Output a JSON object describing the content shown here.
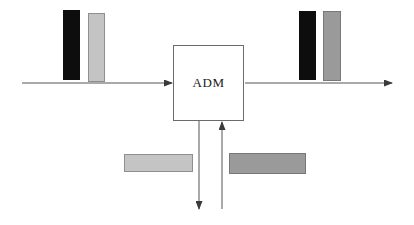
{
  "diagram": {
    "background_color": "#ffffff",
    "line_color": "#555555",
    "node": {
      "label": "ADM",
      "name": "adm-node",
      "x": 173,
      "y": 45,
      "width": 71,
      "height": 76,
      "border_color": "#6b6b6b",
      "fill_color": "#ffffff",
      "border_width": 1
    },
    "arrows": [
      {
        "name": "west-input-arrow",
        "direction": "east",
        "x1": 22,
        "y1": 83,
        "x2": 172,
        "y2": 83,
        "color": "#555555"
      },
      {
        "name": "east-output-arrow",
        "direction": "east",
        "x1": 245,
        "y1": 83,
        "x2": 392,
        "y2": 83,
        "color": "#555555"
      },
      {
        "name": "drop-arrow",
        "direction": "south",
        "x1": 199,
        "y1": 121,
        "x2": 199,
        "y2": 209,
        "color": "#555555"
      },
      {
        "name": "add-arrow",
        "direction": "north",
        "x1": 222,
        "y1": 209,
        "x2": 222,
        "y2": 122,
        "color": "#555555"
      }
    ],
    "bars": [
      {
        "name": "west-channel-bar-dark",
        "orientation": "vertical",
        "x": 63,
        "y": 10,
        "width": 17,
        "height": 70,
        "fill_color": "#0d0d0d",
        "border_color": "#0d0d0d"
      },
      {
        "name": "west-channel-bar-light",
        "orientation": "vertical",
        "x": 88,
        "y": 13,
        "width": 17,
        "height": 69,
        "fill_color": "#c4c4c4",
        "border_color": "#8f8f8f"
      },
      {
        "name": "east-channel-bar-dark",
        "orientation": "vertical",
        "x": 299,
        "y": 11,
        "width": 17,
        "height": 69,
        "fill_color": "#0d0d0d",
        "border_color": "#0d0d0d"
      },
      {
        "name": "east-channel-bar-gray",
        "orientation": "vertical",
        "x": 323,
        "y": 11,
        "width": 18,
        "height": 70,
        "fill_color": "#9a9a9a",
        "border_color": "#787878"
      },
      {
        "name": "drop-channel-bar-light",
        "orientation": "horizontal",
        "x": 124,
        "y": 154,
        "width": 69,
        "height": 18,
        "fill_color": "#c4c4c4",
        "border_color": "#8f8f8f"
      },
      {
        "name": "add-channel-bar-gray",
        "orientation": "horizontal",
        "x": 229,
        "y": 153,
        "width": 77,
        "height": 21,
        "fill_color": "#9a9a9a",
        "border_color": "#787878"
      }
    ]
  }
}
